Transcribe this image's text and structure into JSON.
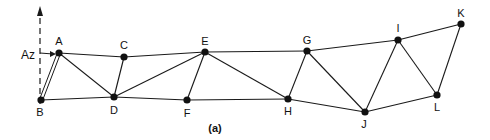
{
  "diagram": {
    "caption": "(a)",
    "reference_label": "Az",
    "nodes": [
      {
        "id": "A",
        "x": 59,
        "y": 53,
        "lx": 59,
        "ly": 41
      },
      {
        "id": "B",
        "x": 41,
        "y": 100,
        "lx": 40,
        "ly": 112
      },
      {
        "id": "C",
        "x": 124,
        "y": 57,
        "lx": 124,
        "ly": 45
      },
      {
        "id": "D",
        "x": 114,
        "y": 97,
        "lx": 114,
        "ly": 110
      },
      {
        "id": "E",
        "x": 205,
        "y": 52,
        "lx": 205,
        "ly": 41
      },
      {
        "id": "F",
        "x": 187,
        "y": 100,
        "lx": 187,
        "ly": 113
      },
      {
        "id": "G",
        "x": 307,
        "y": 51,
        "lx": 307,
        "ly": 40
      },
      {
        "id": "H",
        "x": 288,
        "y": 99,
        "lx": 288,
        "ly": 111
      },
      {
        "id": "I",
        "x": 398,
        "y": 40,
        "lx": 398,
        "ly": 28
      },
      {
        "id": "J",
        "x": 365,
        "y": 112,
        "lx": 364,
        "ly": 124
      },
      {
        "id": "K",
        "x": 461,
        "y": 24,
        "lx": 461,
        "ly": 13
      },
      {
        "id": "L",
        "x": 437,
        "y": 95,
        "lx": 437,
        "ly": 107
      }
    ],
    "edges": [
      [
        "A",
        "C"
      ],
      [
        "C",
        "E"
      ],
      [
        "E",
        "G"
      ],
      [
        "G",
        "I"
      ],
      [
        "I",
        "K"
      ],
      [
        "B",
        "D"
      ],
      [
        "D",
        "F"
      ],
      [
        "F",
        "H"
      ],
      [
        "H",
        "J"
      ],
      [
        "J",
        "L"
      ],
      [
        "A",
        "D"
      ],
      [
        "C",
        "D"
      ],
      [
        "D",
        "E"
      ],
      [
        "E",
        "F"
      ],
      [
        "E",
        "H"
      ],
      [
        "G",
        "H"
      ],
      [
        "G",
        "J"
      ],
      [
        "I",
        "J"
      ],
      [
        "I",
        "L"
      ],
      [
        "K",
        "L"
      ]
    ],
    "double_edge": [
      "A",
      "B"
    ],
    "colors": {
      "line": "#1a1a1a",
      "node": "#111111"
    }
  }
}
